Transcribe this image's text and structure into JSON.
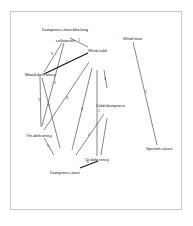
{
  "diagram": {
    "type": "network-graph",
    "nodes": [
      {
        "id": "dampness-heat-blocking-collaterals",
        "label_line1": "Dampness-heat blocking",
        "label_line2": "collaterals",
        "x": 62,
        "y": 31
      },
      {
        "id": "wind-cold",
        "label": "Wind-cold",
        "x": 89,
        "y": 50
      },
      {
        "id": "blood-deficiency",
        "label": "Blood deficiency",
        "x": 40,
        "y": 74
      },
      {
        "id": "cold-dampness",
        "label": "Cold-dampness",
        "x": 100,
        "y": 106
      },
      {
        "id": "yin-deficiency",
        "label": "Yin-deficiency",
        "x": 38,
        "y": 135
      },
      {
        "id": "qi-deficiency",
        "label": "Qi deficiency",
        "x": 91,
        "y": 159
      },
      {
        "id": "dampness-heat",
        "label": "Dampness-heat",
        "x": 66,
        "y": 172
      },
      {
        "id": "wind-heat",
        "label": "Wind-heat",
        "x": 130,
        "y": 39
      },
      {
        "id": "sputum-stasis",
        "label": "Sputum-stasis",
        "x": 159,
        "y": 148
      }
    ],
    "edges": [
      {
        "from": "dampness-heat-blocking-collaterals",
        "to": "wind-cold",
        "label": "1"
      },
      {
        "from": "dampness-heat-blocking-collaterals",
        "to": "blood-deficiency",
        "label": "3"
      },
      {
        "from": "dampness-heat-blocking-collaterals",
        "to": "yin-deficiency",
        "label": "2"
      },
      {
        "from": "wind-cold",
        "to": "blood-deficiency",
        "label": "1"
      },
      {
        "from": "wind-cold",
        "to": "yin-deficiency",
        "label": "3"
      },
      {
        "from": "wind-cold",
        "to": "dampness-heat",
        "label": "4"
      },
      {
        "from": "blood-deficiency",
        "to": "yin-deficiency",
        "label": "1"
      },
      {
        "from": "blood-deficiency",
        "to": "dampness-heat",
        "label": "3"
      },
      {
        "from": "yin-deficiency",
        "to": "dampness-heat",
        "label": "5"
      },
      {
        "from": "cold-dampness",
        "to": "wind-cold",
        "label": "5"
      },
      {
        "from": "cold-dampness",
        "to": "dampness-heat",
        "label": "2"
      },
      {
        "from": "cold-dampness",
        "to": "qi-deficiency",
        "label": "1"
      },
      {
        "from": "qi-deficiency",
        "to": "dampness-heat",
        "label": "1"
      },
      {
        "from": "wind-heat",
        "to": "sputum-stasis",
        "label": "1"
      }
    ]
  }
}
